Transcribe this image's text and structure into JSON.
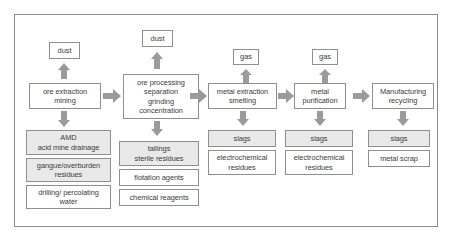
{
  "diagram": {
    "frame": {
      "border_color": "#8d8d8d",
      "background": "#ffffff"
    },
    "colors": {
      "box_border": "#8f8f8f",
      "box_fill_gray": "#e9e9e9",
      "box_fill_white": "#ffffff",
      "arrow": "#9b9b9b",
      "text": "#3a3a3a"
    },
    "emissions": [
      {
        "id": "dust-1",
        "label": "dust"
      },
      {
        "id": "dust-2",
        "label": "dust"
      },
      {
        "id": "gas-1",
        "label": "gas"
      },
      {
        "id": "gas-2",
        "label": "gas"
      }
    ],
    "stages": [
      {
        "id": "ore-extraction",
        "label": "ore extraction\nmining"
      },
      {
        "id": "ore-processing",
        "label": "ore processing\nseparation\ngrinding\nconcentration"
      },
      {
        "id": "metal-extraction",
        "label": "metal extraction\nsmelting"
      },
      {
        "id": "metal-purification",
        "label": "metal\npurification"
      },
      {
        "id": "manufacturing",
        "label": "Manufacturing\nrecycling"
      }
    ],
    "residues": {
      "ore_extraction": [
        {
          "id": "amd",
          "label": "AMD\nacid mine drainage",
          "fill": "gray"
        },
        {
          "id": "gangue",
          "label": "gangue/overburden\nresidues",
          "fill": "gray"
        },
        {
          "id": "drilling-water",
          "label": "drilling/ percolating\nwater",
          "fill": "white"
        }
      ],
      "ore_processing": [
        {
          "id": "tailings",
          "label": "tailings\nsterile residues",
          "fill": "gray"
        },
        {
          "id": "flotation-agents",
          "label": "flotation agents",
          "fill": "white"
        },
        {
          "id": "chemical-reagents",
          "label": "chemical reagents",
          "fill": "white"
        }
      ],
      "metal_extraction": [
        {
          "id": "slags-1",
          "label": "slags",
          "fill": "gray"
        },
        {
          "id": "electrochemical-residues-1",
          "label": "electrochemical\nresidues",
          "fill": "white"
        }
      ],
      "metal_purification": [
        {
          "id": "slags-2",
          "label": "slags",
          "fill": "gray"
        },
        {
          "id": "electrochemical-residues-2",
          "label": "electrochemical\nresidues",
          "fill": "white"
        }
      ],
      "manufacturing": [
        {
          "id": "slags-3",
          "label": "slags",
          "fill": "gray"
        },
        {
          "id": "metal-scrap",
          "label": "metal scrap",
          "fill": "white"
        }
      ]
    }
  }
}
